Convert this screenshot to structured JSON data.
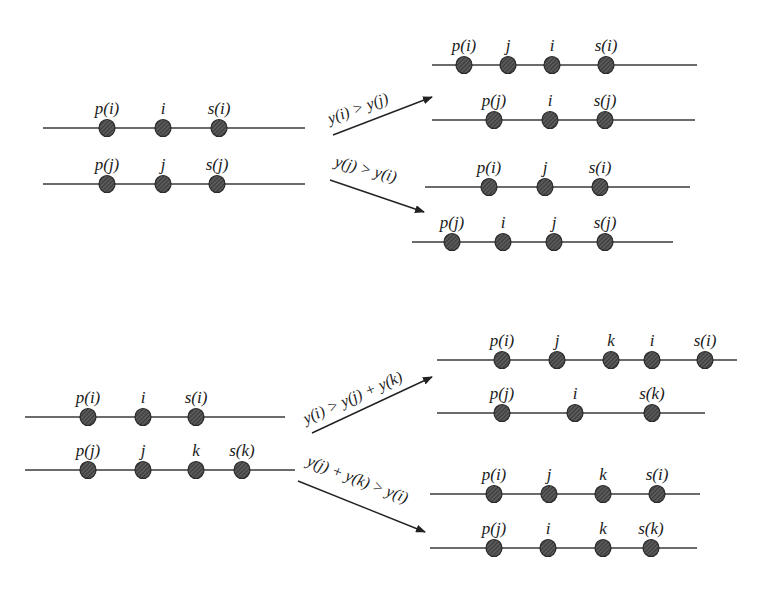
{
  "diagram": {
    "node_color": "#4a4a4a",
    "line_color": "#3a3a3a",
    "panels": [
      {
        "id": "case-1-input",
        "tracks": [
          {
            "y": 128,
            "x1": 43,
            "x2": 305,
            "nodes": [
              {
                "x": 107,
                "label": "p(i)"
              },
              {
                "x": 163,
                "label": "i"
              },
              {
                "x": 219,
                "label": "s(i)"
              }
            ]
          },
          {
            "y": 184,
            "x1": 43,
            "x2": 305,
            "nodes": [
              {
                "x": 107,
                "label": "p(j)"
              },
              {
                "x": 163,
                "label": "j"
              },
              {
                "x": 217,
                "label": "s(j)"
              }
            ]
          }
        ]
      },
      {
        "id": "case-1-result-a",
        "tracks": [
          {
            "y": 65,
            "x1": 432,
            "x2": 697,
            "nodes": [
              {
                "x": 464,
                "label": "p(i)"
              },
              {
                "x": 508,
                "label": "j"
              },
              {
                "x": 552,
                "label": "i"
              },
              {
                "x": 606,
                "label": "s(i)"
              }
            ]
          },
          {
            "y": 120,
            "x1": 432,
            "x2": 695,
            "nodes": [
              {
                "x": 494,
                "label": "p(j)"
              },
              {
                "x": 550,
                "label": "i"
              },
              {
                "x": 605,
                "label": "s(j)"
              }
            ]
          }
        ]
      },
      {
        "id": "case-1-result-b",
        "tracks": [
          {
            "y": 187,
            "x1": 425,
            "x2": 690,
            "nodes": [
              {
                "x": 489,
                "label": "p(i)"
              },
              {
                "x": 545,
                "label": "j"
              },
              {
                "x": 600,
                "label": "s(i)"
              }
            ]
          },
          {
            "y": 242,
            "x1": 412,
            "x2": 673,
            "nodes": [
              {
                "x": 452,
                "label": "p(j)"
              },
              {
                "x": 503,
                "label": "i"
              },
              {
                "x": 554,
                "label": "j"
              },
              {
                "x": 605,
                "label": "s(j)"
              }
            ]
          }
        ]
      },
      {
        "id": "case-2-input",
        "tracks": [
          {
            "y": 417,
            "x1": 25,
            "x2": 285,
            "nodes": [
              {
                "x": 88,
                "label": "p(i)"
              },
              {
                "x": 143,
                "label": "i"
              },
              {
                "x": 196,
                "label": "s(i)"
              }
            ]
          },
          {
            "y": 470,
            "x1": 25,
            "x2": 295,
            "nodes": [
              {
                "x": 88,
                "label": "p(j)"
              },
              {
                "x": 143,
                "label": "j"
              },
              {
                "x": 196,
                "label": "k"
              },
              {
                "x": 242,
                "label": "s(k)"
              }
            ]
          }
        ]
      },
      {
        "id": "case-2-result-a",
        "tracks": [
          {
            "y": 360,
            "x1": 437,
            "x2": 737,
            "nodes": [
              {
                "x": 502,
                "label": "p(i)"
              },
              {
                "x": 557,
                "label": "j"
              },
              {
                "x": 611,
                "label": "k"
              },
              {
                "x": 652,
                "label": "i"
              },
              {
                "x": 705,
                "label": "s(i)"
              }
            ]
          },
          {
            "y": 413,
            "x1": 437,
            "x2": 705,
            "nodes": [
              {
                "x": 502,
                "label": "p(j)"
              },
              {
                "x": 575,
                "label": "i"
              },
              {
                "x": 652,
                "label": "s(k)"
              }
            ]
          }
        ]
      },
      {
        "id": "case-2-result-b",
        "tracks": [
          {
            "y": 494,
            "x1": 430,
            "x2": 700,
            "nodes": [
              {
                "x": 494,
                "label": "p(i)"
              },
              {
                "x": 549,
                "label": "j"
              },
              {
                "x": 603,
                "label": "k"
              },
              {
                "x": 657,
                "label": "s(i)"
              }
            ]
          },
          {
            "y": 548,
            "x1": 430,
            "x2": 697,
            "nodes": [
              {
                "x": 494,
                "label": "p(j)"
              },
              {
                "x": 548,
                "label": "i"
              },
              {
                "x": 603,
                "label": "k"
              },
              {
                "x": 651,
                "label": "s(k)"
              }
            ]
          }
        ]
      }
    ],
    "arrows": [
      {
        "id": "arrow-case1-a",
        "x1": 333,
        "y1": 135,
        "x2": 432,
        "y2": 97,
        "label": "y(i) > y(j)",
        "lx": 330,
        "ly": 124,
        "angle": -20
      },
      {
        "id": "arrow-case1-b",
        "x1": 330,
        "y1": 180,
        "x2": 424,
        "y2": 212,
        "label": "y(j) > y(i)",
        "lx": 334,
        "ly": 166,
        "angle": 15
      },
      {
        "id": "arrow-case2-a",
        "x1": 312,
        "y1": 433,
        "x2": 432,
        "y2": 377,
        "label": "y(i) > y(j) + y(k)",
        "lx": 306,
        "ly": 424,
        "angle": -24
      },
      {
        "id": "arrow-case2-b",
        "x1": 298,
        "y1": 481,
        "x2": 425,
        "y2": 532,
        "label": "y(j) + y(k) > y(i)",
        "lx": 306,
        "ly": 465,
        "angle": 21
      }
    ]
  }
}
